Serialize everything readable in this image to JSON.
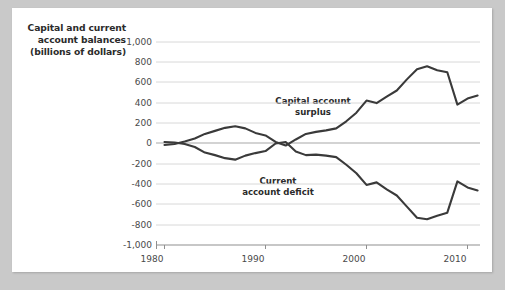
{
  "chart_data": {
    "type": "line",
    "title": "Capital and current account balances (billions of dollars)",
    "title_lines": [
      "Capital and current",
      "account balances",
      "(billions of dollars)"
    ],
    "xlabel": "",
    "ylabel": "Capital and current account balances (billions of dollars)",
    "xlim": [
      1979,
      2011.5
    ],
    "ylim": [
      -1000,
      1000
    ],
    "grid": true,
    "legend_position": "inline-annotations",
    "yticks": [
      "1,000",
      "800",
      "600",
      "400",
      "200",
      "0",
      "-200",
      "-400",
      "-600",
      "-800",
      "-1,000"
    ],
    "ytick_values": [
      1000,
      800,
      600,
      400,
      200,
      0,
      -200,
      -400,
      -600,
      -800,
      -1000
    ],
    "xticks": [
      "1980",
      "1990",
      "2000",
      "2010"
    ],
    "xtick_values": [
      1980,
      1990,
      2000,
      2010
    ],
    "annotations": [
      {
        "text_lines": [
          "Capital account",
          "surplus"
        ],
        "text": "Capital account surplus",
        "x": 1998,
        "y": 400
      },
      {
        "text_lines": [
          "Current",
          "account deficit"
        ],
        "text": "Current account deficit",
        "x": 1996,
        "y": -390
      }
    ],
    "x": [
      1980,
      1981,
      1982,
      1983,
      1984,
      1985,
      1986,
      1987,
      1988,
      1989,
      1990,
      1991,
      1992,
      1993,
      1994,
      1995,
      1996,
      1997,
      1998,
      1999,
      2000,
      2001,
      2002,
      2003,
      2004,
      2005,
      2006,
      2007,
      2008,
      2009,
      2010,
      2011
    ],
    "series": [
      {
        "name": "Capital account surplus",
        "color": "#3a3a3a",
        "values": [
          -20,
          -10,
          15,
          45,
          90,
          120,
          150,
          165,
          145,
          100,
          75,
          10,
          -25,
          35,
          90,
          110,
          125,
          145,
          215,
          300,
          420,
          395,
          460,
          520,
          630,
          730,
          760,
          720,
          700,
          380,
          440,
          470
        ]
      },
      {
        "name": "Current account deficit",
        "color": "#3a3a3a",
        "values": [
          10,
          5,
          -10,
          -40,
          -95,
          -120,
          -150,
          -165,
          -125,
          -100,
          -80,
          -5,
          10,
          -85,
          -120,
          -115,
          -125,
          -140,
          -215,
          -300,
          -415,
          -390,
          -460,
          -520,
          -630,
          -740,
          -755,
          -720,
          -690,
          -380,
          -440,
          -470
        ]
      }
    ]
  }
}
